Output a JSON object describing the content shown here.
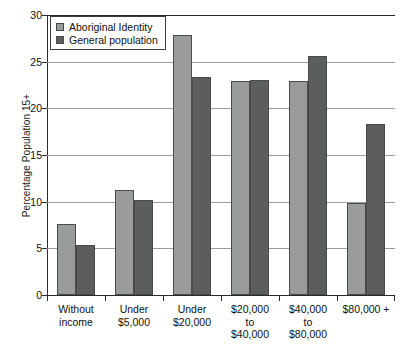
{
  "chart_data": {
    "type": "bar",
    "title": "",
    "xlabel": "",
    "ylabel": "Percentage Population 15+",
    "ylim": [
      0,
      30
    ],
    "yticks": [
      0,
      5,
      10,
      15,
      20,
      25,
      30
    ],
    "ytick_labels": [
      "0",
      "5",
      "10",
      "15",
      "20",
      "25",
      "30"
    ],
    "grid": true,
    "legend_position": "upper left",
    "categories": [
      "Without income",
      "Under $5,000",
      "Under $20,000",
      "$20,000 to $40,000",
      "$40,000 to $80,000",
      "$80,000 +"
    ],
    "category_lines": [
      [
        "Without",
        "income"
      ],
      [
        "Under",
        "$5,000"
      ],
      [
        "Under",
        "$20,000"
      ],
      [
        "$20,000",
        "to",
        "$40,000"
      ],
      [
        "$40,000",
        "to",
        "$80,000"
      ],
      [
        "$80,000 +"
      ]
    ],
    "series": [
      {
        "name": "Aboriginal Identity",
        "color": "#9a9b9b",
        "values": [
          7.6,
          11.3,
          27.9,
          22.9,
          22.9,
          9.9
        ]
      },
      {
        "name": "General population",
        "color": "#5c5d5d",
        "values": [
          5.4,
          10.2,
          23.4,
          23.0,
          25.6,
          18.3
        ]
      }
    ]
  },
  "legend": {
    "items": [
      {
        "label": "Aboriginal Identity",
        "color": "#9a9b9b"
      },
      {
        "label": "General population",
        "color": "#5c5d5d"
      }
    ]
  },
  "axis": {
    "y_title": "Percentage Population 15+"
  }
}
